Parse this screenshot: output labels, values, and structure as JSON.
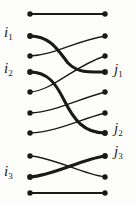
{
  "figure": {
    "type": "braid-diagram",
    "title": "",
    "width": 136,
    "height": 206,
    "background_color": "#fdfdfc",
    "stroke_color": "#1a1a1a",
    "node_color": "#1a1a1a"
  },
  "labels": {
    "left": [
      {
        "id": "i1",
        "base": "i",
        "sub": "1",
        "x": 4,
        "y": 30
      },
      {
        "id": "i2",
        "base": "i",
        "sub": "2",
        "x": 4,
        "y": 65
      },
      {
        "id": "i3",
        "base": "i",
        "sub": "3",
        "x": 4,
        "y": 160
      }
    ],
    "right": [
      {
        "id": "j1",
        "base": "j",
        "sub": "1",
        "x": 115,
        "y": 65
      },
      {
        "id": "j2",
        "base": "j",
        "sub": "2",
        "x": 115,
        "y": 122
      },
      {
        "id": "j3",
        "base": "j",
        "sub": "3",
        "x": 115,
        "y": 143
      }
    ]
  },
  "nodes": {
    "left_x": 30,
    "right_x": 105,
    "rows_y": [
      14,
      36,
      56,
      72,
      92,
      113,
      133,
      156,
      193
    ],
    "radius": 2.6,
    "count_left": 9,
    "count_right": 9
  },
  "strands": [
    {
      "name": "top-rail",
      "from_row": 0,
      "to_row": 0,
      "weight": "thin",
      "shape": "straight"
    },
    {
      "name": "i1-to-j1",
      "from_row": 1,
      "to_row": 3,
      "weight": "thick",
      "shape": "curve"
    },
    {
      "name": "row2-to-row1",
      "from_row": 2,
      "to_row": 1,
      "weight": "thin",
      "shape": "curve"
    },
    {
      "name": "i2-to-j2",
      "from_row": 3,
      "to_row": 6,
      "weight": "thick",
      "shape": "curve"
    },
    {
      "name": "row4-to-row2",
      "from_row": 4,
      "to_row": 2,
      "weight": "thin",
      "shape": "curve"
    },
    {
      "name": "row5-to-row4",
      "from_row": 5,
      "to_row": 4,
      "weight": "thin",
      "shape": "curve"
    },
    {
      "name": "row6-to-row5",
      "from_row": 6,
      "to_row": 5,
      "weight": "thin",
      "shape": "curve"
    },
    {
      "name": "row7-to-row8",
      "from_row": 7,
      "to_row": 8,
      "weight": "thin",
      "shape": "curve"
    },
    {
      "name": "i3-to-j3",
      "from_row": 8,
      "to_row": 7,
      "weight": "thick",
      "shape": "curve"
    },
    {
      "name": "bottom-rail",
      "from_row": 9,
      "to_row": 9,
      "weight": "thin",
      "shape": "straight"
    }
  ],
  "stroke_widths": {
    "thin": 1.3,
    "thick": 3.0,
    "rail": 1.8
  }
}
